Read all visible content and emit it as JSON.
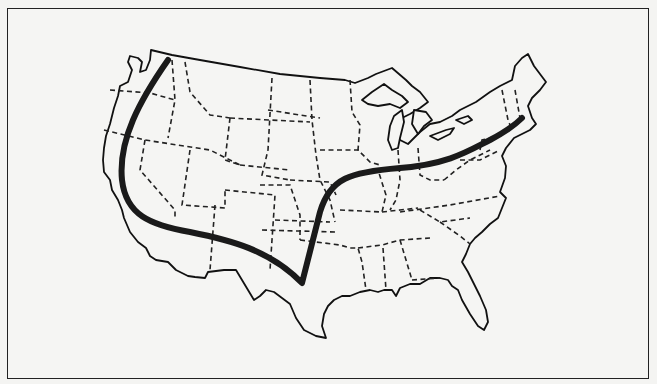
{
  "map": {
    "title": "",
    "subject": "Contiguous United States outline map",
    "style": "black line art on white",
    "elements": {
      "frame": "rectangular border",
      "country_outline": "solid line",
      "state_borders": "dashed lines",
      "highlighted_boundary": "thick solid curve from Washington coast south through California, east across southern Arizona/New Mexico to west Texas, north through Oklahoma/Kansas, then east-northeast across Missouri, Illinois, Indiana, Ohio, Pennsylvania to southern New England"
    },
    "colors": {
      "background": "#f5f5f3",
      "lines": "#111111"
    }
  }
}
